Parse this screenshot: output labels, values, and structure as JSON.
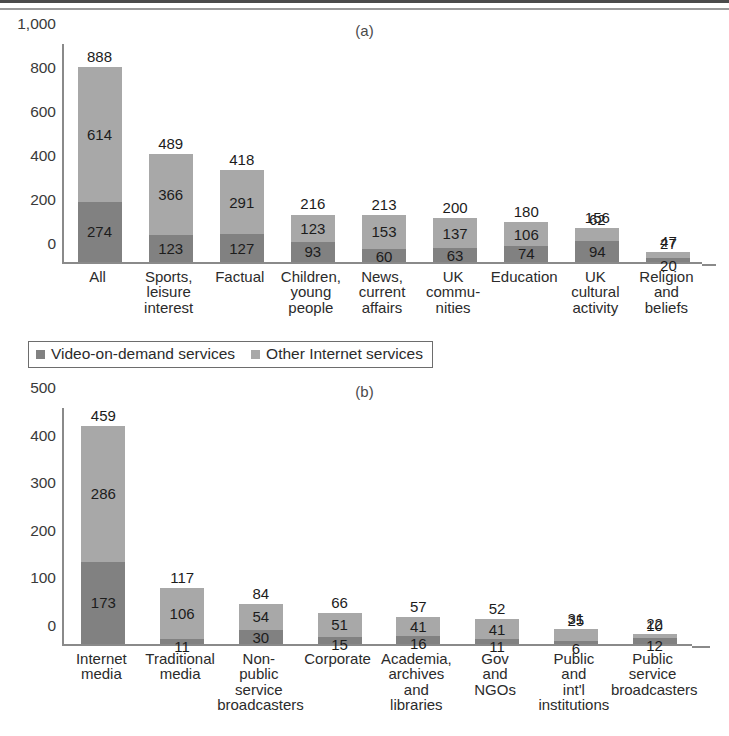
{
  "figure": {
    "panel_a_letter": "(a)",
    "panel_b_letter": "(b)"
  },
  "legend": {
    "items": [
      {
        "label": "Video-on-demand services",
        "color": "#818181"
      },
      {
        "label": "Other Internet services",
        "color": "#a8a8a8"
      }
    ]
  },
  "chart_data": [
    {
      "type": "bar",
      "id": "panel-a",
      "title": "(a)",
      "stacked": true,
      "xlabel": "",
      "ylabel": "",
      "ylim": [
        0,
        1000
      ],
      "yticks": [
        0,
        200,
        400,
        600,
        800,
        1000
      ],
      "ytick_labels": [
        "0",
        "200",
        "400",
        "600",
        "800",
        "1,000"
      ],
      "grid": false,
      "legend_position": "below-panel-a",
      "categories": [
        "All",
        "Sports,\nleisure\ninterest",
        "Factual",
        "Children,\nyoung\npeople",
        "News,\ncurrent\naffairs",
        "UK\ncommu-\nnities",
        "Education",
        "UK\ncultural\nactivity",
        "Religion\nand\nbeliefs"
      ],
      "series": [
        {
          "name": "Video-on-demand services",
          "color": "#818181",
          "values": [
            274,
            123,
            127,
            93,
            60,
            63,
            74,
            94,
            20
          ]
        },
        {
          "name": "Other Internet services",
          "color": "#a8a8a8",
          "values": [
            614,
            366,
            291,
            123,
            153,
            137,
            106,
            62,
            27
          ]
        }
      ],
      "totals": [
        888,
        489,
        418,
        216,
        213,
        200,
        180,
        156,
        47
      ]
    },
    {
      "type": "bar",
      "id": "panel-b",
      "title": "(b)",
      "stacked": true,
      "xlabel": "",
      "ylabel": "",
      "ylim": [
        0,
        500
      ],
      "yticks": [
        0,
        100,
        200,
        300,
        400,
        500
      ],
      "ytick_labels": [
        "0",
        "100",
        "200",
        "300",
        "400",
        "500"
      ],
      "grid": false,
      "legend_position": "shared-above",
      "categories": [
        "Internet\nmedia",
        "Traditional\nmedia",
        "Non-\npublic\nservice\nbroadcasters",
        "Corporate",
        "Academia,\narchives\nand\nlibraries",
        "Gov\nand\nNGOs",
        "Public\nand\nint'l\ninstitutions",
        "Public\nservice\nbroadcasters"
      ],
      "series": [
        {
          "name": "Video-on-demand services",
          "color": "#818181",
          "values": [
            173,
            11,
            30,
            15,
            16,
            11,
            6,
            12
          ]
        },
        {
          "name": "Other Internet services",
          "color": "#a8a8a8",
          "values": [
            286,
            106,
            54,
            51,
            41,
            41,
            25,
            10
          ]
        }
      ],
      "totals": [
        459,
        117,
        84,
        66,
        57,
        52,
        31,
        22
      ]
    }
  ]
}
